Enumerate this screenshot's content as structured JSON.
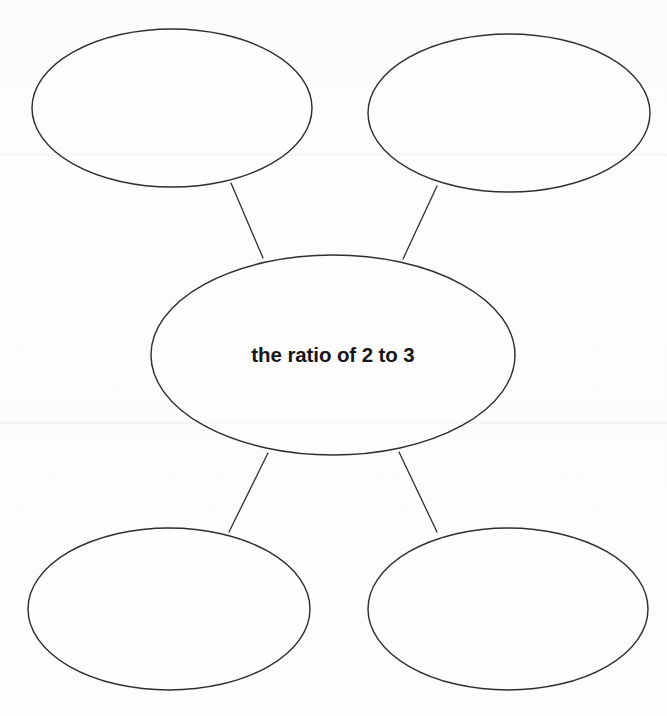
{
  "document": {
    "kind": "concept-web-graphic-organizer",
    "center_topic": "the ratio of 2 to 3",
    "background_color": "#fcfcfd",
    "stroke_color": "#2f2f33",
    "text_color": "#171719"
  },
  "center_node": {
    "label": "the ratio of 2 to 3",
    "cx": 333,
    "cy": 355,
    "rx": 182,
    "ry": 100
  },
  "outer_nodes": [
    {
      "name": "top-left",
      "label": "",
      "cx": 172,
      "cy": 108,
      "rx": 140,
      "ry": 79
    },
    {
      "name": "top-right",
      "label": "",
      "cx": 509,
      "cy": 113,
      "rx": 141,
      "ry": 79
    },
    {
      "name": "bottom-left",
      "label": "",
      "cx": 169,
      "cy": 609,
      "rx": 141,
      "ry": 81
    },
    {
      "name": "bottom-right",
      "label": "",
      "cx": 508,
      "cy": 609,
      "rx": 140,
      "ry": 81
    }
  ],
  "connectors": [
    {
      "name": "connector-top-left",
      "x1": 231,
      "y1": 183,
      "x2": 263,
      "y2": 258
    },
    {
      "name": "connector-top-right",
      "x1": 437,
      "y1": 186,
      "x2": 403,
      "y2": 259
    },
    {
      "name": "connector-bottom-left",
      "x1": 268,
      "y1": 453,
      "x2": 229,
      "y2": 532
    },
    {
      "name": "connector-bottom-right",
      "x1": 399,
      "y1": 452,
      "x2": 437,
      "y2": 532
    }
  ]
}
